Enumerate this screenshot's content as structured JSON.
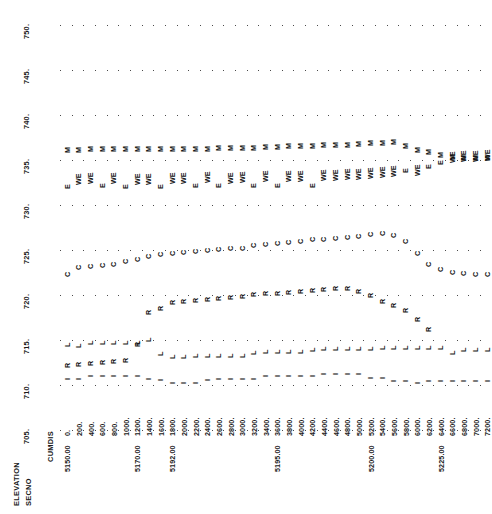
{
  "chart_data": {
    "type": "scatter",
    "title": "",
    "subtitle": "",
    "xlabel": "CUMDIS",
    "ylabel": "ELEVATION",
    "secondary_xlabel": "SECNO",
    "grid": true,
    "legend_position": "none",
    "ylim": [
      705,
      750
    ],
    "yticks": [
      705,
      710,
      715,
      720,
      725,
      730,
      735,
      740,
      745,
      750
    ],
    "ytick_labels": [
      "705.",
      "710.",
      "715.",
      "720.",
      "725.",
      "730.",
      "735.",
      "740.",
      "745.",
      "750."
    ],
    "xlim": [
      0,
      7200
    ],
    "xticks": [
      0,
      200,
      400,
      600,
      800,
      1000,
      1200,
      1400,
      1600,
      1800,
      2000,
      2200,
      2400,
      2600,
      2800,
      3000,
      3200,
      3400,
      3600,
      3800,
      4000,
      4200,
      4400,
      4600,
      4800,
      5000,
      5200,
      5400,
      5600,
      5800,
      6000,
      6200,
      6400,
      6600,
      6800,
      7000,
      7200
    ],
    "xtick_labels": [
      "0.",
      "200.",
      "400.",
      "600.",
      "800.",
      "1000.",
      "1200.",
      "1400.",
      "1600.",
      "1800.",
      "2000.",
      "2200.",
      "2400.",
      "2600.",
      "2800.",
      "3000.",
      "3200.",
      "3400.",
      "3600.",
      "3800.",
      "4000.",
      "4200.",
      "4400.",
      "4600.",
      "4800.",
      "5000.",
      "5200.",
      "5400.",
      "5600.",
      "5800.",
      "6000.",
      "6200.",
      "6400.",
      "6600.",
      "6800.",
      "7000.",
      "7200."
    ],
    "secno_labels": [
      {
        "x": 0,
        "label": "5150.00"
      },
      {
        "x": 1200,
        "label": "5170.00"
      },
      {
        "x": 1800,
        "label": "5192.00"
      },
      {
        "x": 3600,
        "label": "5195.00"
      },
      {
        "x": 5200,
        "label": "5200.00"
      },
      {
        "x": 6400,
        "label": "5225.00"
      }
    ],
    "series": [
      {
        "name": "M",
        "symbol": "M",
        "values": [
          736.1,
          736.1,
          736.3,
          736.3,
          736.3,
          736.3,
          736.3,
          736.3,
          736.2,
          736.2,
          736.3,
          736.3,
          736.3,
          736.4,
          736.4,
          736.4,
          736.4,
          736.5,
          736.5,
          736.6,
          736.6,
          736.6,
          736.7,
          736.7,
          736.7,
          736.8,
          736.9,
          736.9,
          737.0,
          736.6,
          736.1,
          735.9,
          735.6,
          735.4,
          735.3,
          735.2,
          735.2
        ]
      },
      {
        "name": "E",
        "symbol": "E",
        "values": [
          732.1,
          732.6,
          732.7,
          732.2,
          732.7,
          732.1,
          732.6,
          732.6,
          732.1,
          732.7,
          732.7,
          732.2,
          732.8,
          732.2,
          732.7,
          732.8,
          732.2,
          732.9,
          732.3,
          732.9,
          732.9,
          732.3,
          733.0,
          733.0,
          733.1,
          733.1,
          733.2,
          733.4,
          733.5,
          733.9,
          733.6,
          734.4,
          734.8,
          735.0,
          735.1,
          735.1,
          735.2
        ]
      },
      {
        "name": "W",
        "symbol": "W",
        "values": [
          null,
          732.9,
          733.0,
          null,
          733.0,
          null,
          732.9,
          732.9,
          null,
          733.0,
          733.0,
          null,
          733.1,
          null,
          733.0,
          733.1,
          null,
          733.2,
          null,
          733.2,
          733.2,
          null,
          733.3,
          733.3,
          733.4,
          733.4,
          733.5,
          733.7,
          733.8,
          null,
          733.9,
          null,
          null,
          735.3,
          735.4,
          735.4,
          735.5
        ]
      },
      {
        "name": "C",
        "symbol": "C",
        "values": [
          722.4,
          723.1,
          723.3,
          723.4,
          723.5,
          723.8,
          724.0,
          724.4,
          724.6,
          724.7,
          724.8,
          724.9,
          725.0,
          725.1,
          725.2,
          725.3,
          725.6,
          725.7,
          725.8,
          725.9,
          726.0,
          726.2,
          726.3,
          726.4,
          726.5,
          726.6,
          726.8,
          726.9,
          726.7,
          726.0,
          724.7,
          723.5,
          722.9,
          722.6,
          722.5,
          722.4,
          722.4
        ]
      },
      {
        "name": "R",
        "symbol": "R",
        "values": [
          712.3,
          712.4,
          712.5,
          712.6,
          712.7,
          712.8,
          714.6,
          718.1,
          718.6,
          719.2,
          719.4,
          719.5,
          719.6,
          719.7,
          719.8,
          719.9,
          720.1,
          720.2,
          720.3,
          720.4,
          720.5,
          720.6,
          720.7,
          720.8,
          720.8,
          720.5,
          720.0,
          719.4,
          718.9,
          718.4,
          717.4,
          716.3,
          null,
          null,
          null,
          null,
          null
        ]
      },
      {
        "name": "L",
        "symbol": "L",
        "values": [
          714.6,
          714.5,
          714.8,
          714.8,
          714.8,
          714.8,
          714.8,
          715.1,
          713.6,
          713.3,
          713.3,
          713.4,
          713.4,
          713.4,
          713.4,
          713.4,
          713.7,
          713.8,
          713.8,
          713.8,
          713.8,
          714.0,
          714.1,
          714.1,
          714.1,
          714.1,
          714.1,
          714.2,
          714.2,
          714.2,
          714.2,
          714.3,
          714.3,
          713.7,
          714.0,
          714.0,
          714.0
        ]
      },
      {
        "name": "I",
        "symbol": "I",
        "values": [
          710.9,
          710.9,
          711.2,
          711.2,
          711.2,
          711.2,
          711.2,
          710.9,
          710.8,
          710.5,
          710.5,
          710.5,
          710.8,
          710.9,
          710.9,
          710.9,
          710.9,
          711.2,
          711.3,
          711.3,
          711.3,
          711.3,
          711.5,
          711.5,
          711.5,
          711.5,
          711.0,
          711.0,
          710.7,
          710.7,
          710.5,
          710.7,
          710.7,
          710.7,
          710.7,
          710.7,
          710.7
        ]
      }
    ]
  }
}
